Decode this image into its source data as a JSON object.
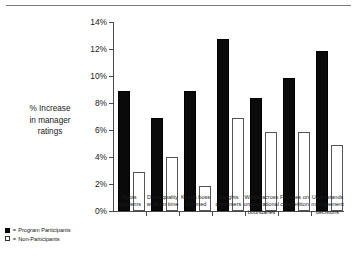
{
  "chart_data": {
    "type": "bar",
    "title": "",
    "subtitle": "",
    "xlabel": "",
    "ylabel": "% Increase in manager ratings",
    "ylim": [
      0,
      14
    ],
    "ytick_labels": [
      "0%",
      "2%",
      "4%",
      "6%",
      "8%",
      "10%",
      "12%",
      "14%"
    ],
    "ytick_values": [
      0,
      2,
      4,
      6,
      8,
      10,
      12,
      14
    ],
    "grid": false,
    "legend_position": "bottom-left",
    "categories": [
      "Spots problems",
      "Does quality work on time",
      "Keeps boss informed",
      "Delights customers",
      "Works across organizational boundaries",
      "Focuses on competition",
      "Understands management decisions"
    ],
    "category_lines": [
      [
        "Spots",
        "problems"
      ],
      [
        "Does quality",
        "work on time"
      ],
      [
        "Keeps boss",
        "informed"
      ],
      [
        "Delights",
        "customers"
      ],
      [
        "Works across",
        "organizational",
        "boundaries"
      ],
      [
        "Focuses on",
        "competition"
      ],
      [
        "Understands",
        "management",
        "decisions"
      ]
    ],
    "series": [
      {
        "name": "Program Participants",
        "color": "#0a0a0a",
        "values": [
          8.9,
          6.9,
          8.9,
          12.8,
          8.4,
          9.9,
          11.9
        ]
      },
      {
        "name": "Non-Participants",
        "color": "#ffffff",
        "values": [
          2.9,
          4.0,
          1.9,
          6.9,
          5.9,
          5.9,
          4.9
        ]
      }
    ]
  },
  "axis_title_lines": [
    "% Increase",
    "in manager",
    "ratings"
  ],
  "legend": {
    "items": [
      {
        "marker": "filled-square",
        "separator": "=",
        "label": "Program Participants"
      },
      {
        "marker": "open-square",
        "separator": "=",
        "label": "Non-Participants"
      }
    ]
  }
}
